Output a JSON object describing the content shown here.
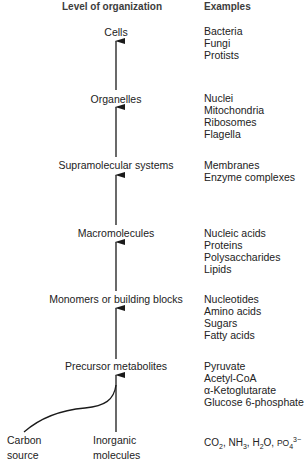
{
  "headers": {
    "level": "Level of organization",
    "examples": "Examples"
  },
  "levels": [
    {
      "name": "Cells",
      "examples": [
        "Bacteria",
        "Fungi",
        "Protists"
      ]
    },
    {
      "name": "Organelles",
      "examples": [
        "Nuclei",
        "Mitochondria",
        "Ribosomes",
        "Flagella"
      ]
    },
    {
      "name": "Supramolecular systems",
      "examples": [
        "Membranes",
        "Enzyme complexes"
      ]
    },
    {
      "name": "Macromolecules",
      "examples": [
        "Nucleic acids",
        "Proteins",
        "Polysaccharides",
        "Lipids"
      ]
    },
    {
      "name": "Monomers or building blocks",
      "examples": [
        "Nucleotides",
        "Amino acids",
        "Sugars",
        "Fatty acids"
      ]
    },
    {
      "name": "Precursor metabolites",
      "examples": [
        "Pyruvate",
        "Acetyl-CoA",
        "α-Ketoglutarate",
        "Glucose 6-phosphate"
      ]
    }
  ],
  "sources": {
    "carbon": [
      "Carbon",
      "source"
    ],
    "inorganic": [
      "Inorganic",
      "molecules"
    ],
    "inorganic_examples": {
      "co2": [
        "CO",
        "2"
      ],
      "nh3": [
        "NH",
        "3"
      ],
      "h2o": [
        "H",
        "2",
        "O"
      ],
      "po4": [
        "PO",
        "4",
        "3−"
      ],
      "sep": ", "
    }
  },
  "colors": {
    "text": "#222222",
    "header": "#3c3c3c",
    "arrow": "#1a1a1a"
  }
}
